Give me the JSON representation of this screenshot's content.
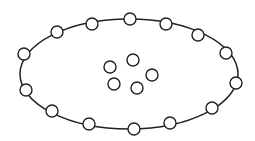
{
  "diagram": {
    "background": "#ffffff",
    "stroke_color": "#222222",
    "ellipse": {
      "cx": 129,
      "cy": 74,
      "rx": 109,
      "ry": 55
    },
    "node_radius": 6,
    "outer_nodes": [
      {
        "x": 24,
        "y": 54
      },
      {
        "x": 57,
        "y": 32
      },
      {
        "x": 92,
        "y": 24
      },
      {
        "x": 130,
        "y": 19
      },
      {
        "x": 166,
        "y": 24
      },
      {
        "x": 198,
        "y": 35
      },
      {
        "x": 226,
        "y": 53
      },
      {
        "x": 236,
        "y": 83
      },
      {
        "x": 212,
        "y": 108
      },
      {
        "x": 170,
        "y": 123
      },
      {
        "x": 134,
        "y": 129
      },
      {
        "x": 89,
        "y": 124
      },
      {
        "x": 52,
        "y": 111
      },
      {
        "x": 26,
        "y": 90
      }
    ],
    "inner_nodes": [
      {
        "x": 110,
        "y": 67
      },
      {
        "x": 133,
        "y": 60
      },
      {
        "x": 152,
        "y": 75
      },
      {
        "x": 114,
        "y": 84
      },
      {
        "x": 137,
        "y": 88
      }
    ]
  }
}
